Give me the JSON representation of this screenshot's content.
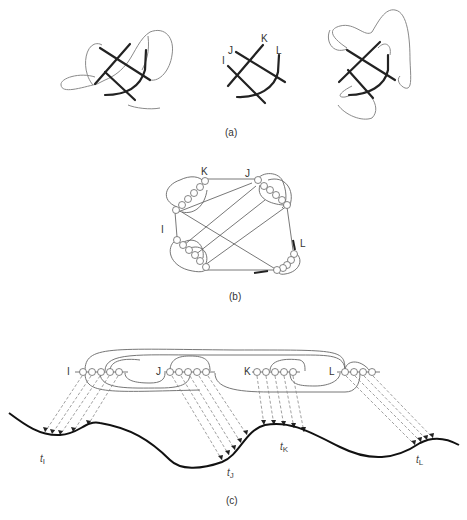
{
  "panels": {
    "a": {
      "caption": "(a)",
      "strand_labels": [
        "I",
        "J",
        "K",
        "L"
      ]
    },
    "b": {
      "caption": "(b)",
      "node_labels": [
        "K",
        "J",
        "I",
        "L"
      ]
    },
    "c": {
      "caption": "(c)",
      "group_labels": [
        "I",
        "J",
        "K",
        "L"
      ],
      "curve_labels": [
        {
          "t": "t",
          "sub": "I"
        },
        {
          "t": "t",
          "sub": "J"
        },
        {
          "t": "t",
          "sub": "K"
        },
        {
          "t": "t",
          "sub": "L"
        }
      ]
    }
  }
}
